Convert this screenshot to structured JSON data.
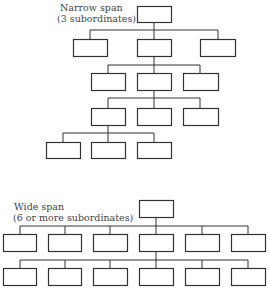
{
  "narrow": {
    "title": "Narrow span",
    "subtitle": "(3 subordinates)"
  },
  "wide": {
    "title": "Wide span",
    "subtitle": "(6 or more subordinates)"
  },
  "colors": {
    "line": "#333333",
    "box_fill": "#ffffff",
    "text": "#444444"
  }
}
